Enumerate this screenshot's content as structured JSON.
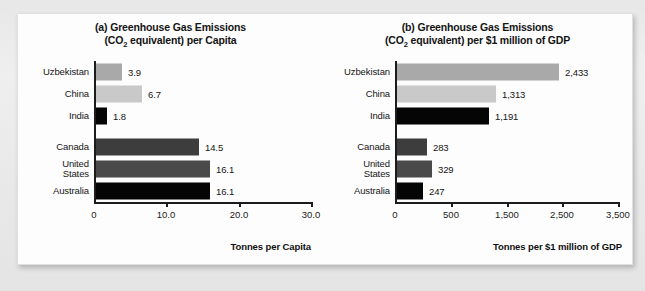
{
  "figure": {
    "background_color": "#ececed",
    "panel_color": "#fdfdfd"
  },
  "chart_data": [
    {
      "type": "bar",
      "orientation": "horizontal",
      "panel_label": "(a)",
      "title": "(a) Greenhouse Gas Emissions",
      "title_line1": "(a) Greenhouse Gas Emissions",
      "title_line2_pre": "(CO",
      "title_line2_sub": "2",
      "title_line2_post": " equivalent) per Capita",
      "xlabel": "Tonnes per Capita",
      "ylabel": "",
      "xlim": [
        0,
        30
      ],
      "xticks": [
        0,
        10,
        20,
        30
      ],
      "xtick_labels": [
        "0",
        "10.0",
        "20.0",
        "30.0"
      ],
      "grid": false,
      "legend": "none",
      "categories": [
        "Uzbekistan",
        "China",
        "India",
        "Canada",
        "United States",
        "Australia"
      ],
      "values": [
        3.9,
        6.7,
        1.8,
        14.5,
        16.1,
        16.1
      ],
      "value_labels": [
        "3.9",
        "6.7",
        "1.8",
        "14.5",
        "16.1",
        "16.1"
      ],
      "bar_colors": [
        "#a9a9a9",
        "#c9c9c9",
        "#050505",
        "#3d3d3d",
        "#4a4a4a",
        "#050505"
      ]
    },
    {
      "type": "bar",
      "orientation": "horizontal",
      "panel_label": "(b)",
      "title": "(b) Greenhouse Gas Emissions",
      "title_line1": "(b) Greenhouse Gas Emissions",
      "title_line2_pre": "(CO",
      "title_line2_sub": "2",
      "title_line2_post": " equivalent) per $1 million of GDP",
      "xlabel": "Tonnes per $1 million of GDP",
      "ylabel": "",
      "xlim": [
        0,
        3500
      ],
      "xticks": [
        0,
        500,
        1500,
        2500,
        3500
      ],
      "xtick_labels": [
        "0",
        "500",
        "1,500",
        "2,500",
        "3,500"
      ],
      "grid": false,
      "legend": "none",
      "categories": [
        "Uzbekistan",
        "China",
        "India",
        "Canada",
        "United States",
        "Australia"
      ],
      "values": [
        2433,
        1313,
        1191,
        283,
        329,
        247
      ],
      "value_labels": [
        "2,433",
        "1,313",
        "1,191",
        "283",
        "329",
        "247"
      ],
      "bar_colors": [
        "#a9a9a9",
        "#c9c9c9",
        "#050505",
        "#3d3d3d",
        "#4a4a4a",
        "#050505"
      ]
    }
  ],
  "chart_a": {
    "title_line1": "(a) Greenhouse Gas Emissions",
    "title_l2_pre": "(CO",
    "title_l2_sub": "2",
    "title_l2_post": " equivalent) per Capita",
    "axis_title": "Tonnes per Capita",
    "ticks": [
      {
        "label": "0"
      },
      {
        "label": "10.0"
      },
      {
        "label": "20.0"
      },
      {
        "label": "30.0"
      }
    ],
    "bars": [
      {
        "label": "Uzbekistan",
        "label2": "",
        "value": "3.9"
      },
      {
        "label": "China",
        "label2": "",
        "value": "6.7"
      },
      {
        "label": "India",
        "label2": "",
        "value": "1.8"
      },
      {
        "label": "Canada",
        "label2": "",
        "value": "14.5"
      },
      {
        "label": "United",
        "label2": "States",
        "value": "16.1"
      },
      {
        "label": "Australia",
        "label2": "",
        "value": "16.1"
      }
    ]
  },
  "chart_b": {
    "title_line1": "(b) Greenhouse Gas Emissions",
    "title_l2_pre": "(CO",
    "title_l2_sub": "2",
    "title_l2_post": " equivalent) per $1 million of GDP",
    "axis_title": "Tonnes per $1 million of GDP",
    "ticks": [
      {
        "label": "0"
      },
      {
        "label": "500"
      },
      {
        "label": "1,500"
      },
      {
        "label": "2,500"
      },
      {
        "label": "3,500"
      }
    ],
    "bars": [
      {
        "label": "Uzbekistan",
        "label2": "",
        "value": "2,433"
      },
      {
        "label": "China",
        "label2": "",
        "value": "1,313"
      },
      {
        "label": "India",
        "label2": "",
        "value": "1,191"
      },
      {
        "label": "Canada",
        "label2": "",
        "value": "283"
      },
      {
        "label": "United",
        "label2": "States",
        "value": "329"
      },
      {
        "label": "Australia",
        "label2": "",
        "value": "247"
      }
    ]
  }
}
